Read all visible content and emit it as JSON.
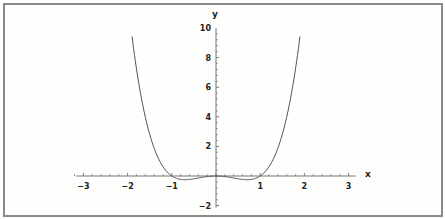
{
  "chart_data": {
    "type": "line",
    "title": "",
    "function": "y = x^4 - x^2",
    "xlabel": "x",
    "ylabel": "y",
    "xlim": [
      -3,
      3
    ],
    "ylim": [
      -2,
      10
    ],
    "x_ticks": [
      -3,
      -2,
      -1,
      1,
      2,
      3
    ],
    "x_tick_labels": [
      "−3",
      "−2",
      "−1",
      "1",
      "2",
      "3"
    ],
    "y_ticks": [
      10,
      8,
      6,
      4,
      2,
      -2
    ],
    "y_tick_labels": [
      "10",
      "8",
      "6",
      "4",
      "2",
      "−2"
    ],
    "grid": false,
    "legend": null,
    "series": [
      {
        "name": "f(x)",
        "x": [
          -1.9,
          -1.75,
          -1.5,
          -1.25,
          -1.0,
          -0.75,
          -0.707,
          -0.5,
          -0.25,
          0,
          0.25,
          0.5,
          0.707,
          0.75,
          1.0,
          1.25,
          1.5,
          1.75,
          1.9
        ],
        "values": [
          9.42,
          6.32,
          2.81,
          0.88,
          0.0,
          -0.25,
          -0.25,
          -0.19,
          -0.06,
          0.0,
          -0.06,
          -0.19,
          -0.25,
          -0.25,
          0.0,
          0.88,
          2.81,
          6.32,
          9.42
        ]
      }
    ],
    "colors": {
      "curve": "#555555",
      "axes": "#777777",
      "frame": "#8a8a8a"
    }
  }
}
